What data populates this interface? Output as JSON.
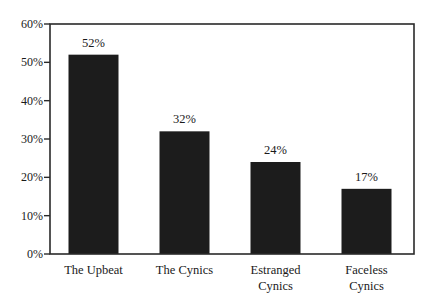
{
  "chart_data": {
    "type": "bar",
    "title": "",
    "xlabel": "",
    "ylabel": "",
    "categories": [
      "The Upbeat",
      "The Cynics",
      "Estranged Cynics",
      "Faceless Cynics"
    ],
    "category_lines": [
      [
        "The Upbeat"
      ],
      [
        "The Cynics"
      ],
      [
        "Estranged",
        "Cynics"
      ],
      [
        "Faceless",
        "Cynics"
      ]
    ],
    "values": [
      52,
      32,
      24,
      17
    ],
    "value_labels": [
      "52%",
      "32%",
      "24%",
      "17%"
    ],
    "ylim": [
      0,
      60
    ],
    "yticks": [
      0,
      10,
      20,
      30,
      40,
      50,
      60
    ],
    "ytick_labels": [
      "0%",
      "10%",
      "20%",
      "30%",
      "40%",
      "50%",
      "60%"
    ],
    "grid": false,
    "legend": null,
    "bar_color": "#1c1c1c",
    "frame": "box"
  }
}
